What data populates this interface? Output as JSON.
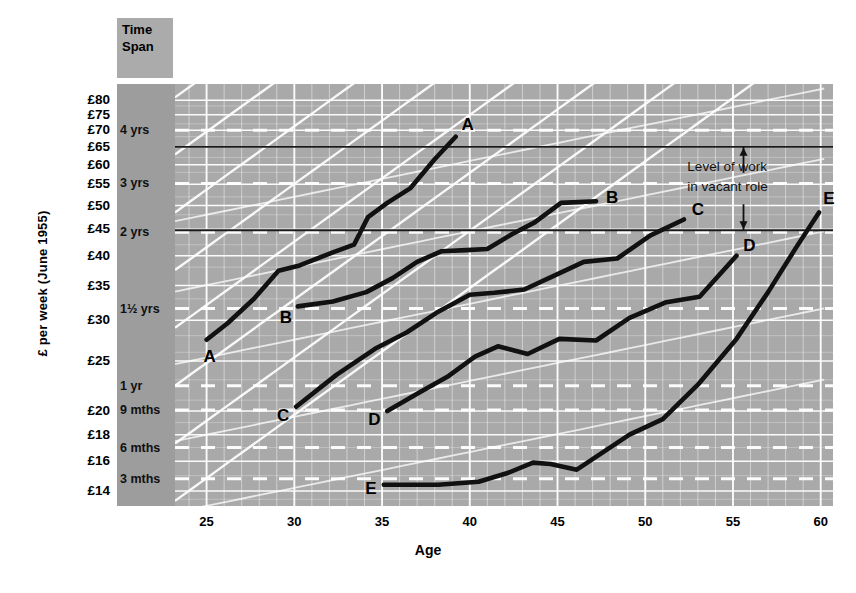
{
  "axes": {
    "ylabel": "£ per week (June 1955)",
    "xlabel": "Age",
    "timespan_header_line1": "Time",
    "timespan_header_line2": "Span",
    "x_ticks": [
      "25",
      "30",
      "35",
      "40",
      "45",
      "50",
      "55",
      "60"
    ],
    "x_tick_values": [
      25,
      30,
      35,
      40,
      45,
      50,
      55,
      60
    ],
    "x_range": [
      23.2,
      60.7
    ],
    "y_ticks": [
      "£80",
      "£75",
      "£70",
      "£65",
      "£60",
      "£55",
      "£50",
      "£45",
      "£40",
      "£35",
      "£30",
      "£25",
      "£20",
      "£18",
      "£16",
      "£14"
    ],
    "y_tick_values": [
      80,
      75,
      70,
      65,
      60,
      55,
      50,
      45,
      40,
      35,
      30,
      25,
      20,
      18,
      16,
      14
    ],
    "y_range": [
      13.1,
      86.0
    ],
    "y_scale": "log"
  },
  "timespan_labels": [
    {
      "label": "4 yrs",
      "value": 70.0
    },
    {
      "label": "3 yrs",
      "value": 55.2
    },
    {
      "label": "2 yrs",
      "value": 44.4
    },
    {
      "label": "1½ yrs",
      "value": 31.6
    },
    {
      "label": "1 yr",
      "value": 22.4
    },
    {
      "label": "9 mths",
      "value": 20.1
    },
    {
      "label": "6 mths",
      "value": 17.0
    },
    {
      "label": "3 mths",
      "value": 14.8
    }
  ],
  "reference_lines": [
    {
      "name": "upper-level-of-work",
      "value": 65.0
    },
    {
      "name": "lower-level-of-work",
      "value": 44.8
    }
  ],
  "annotation": {
    "line1": "Level of work",
    "line2": "in vacant role",
    "arrow_up": "▲",
    "arrow_down": "▼"
  },
  "chart_data": {
    "type": "line",
    "subtitle": "Earnings progression curves with time-span of discretion bands",
    "xlabel": "Age",
    "ylabel": "£ per week (June 1955)",
    "xlim": [
      23.2,
      60.7
    ],
    "ylim": [
      13.1,
      86.0
    ],
    "yscale": "log",
    "grid": true,
    "legend": "inline end-of-line labels",
    "series": [
      {
        "name": "A",
        "label_start": "A",
        "label_end": "A",
        "x": [
          25.0,
          26.2,
          27.7,
          29.1,
          30.3,
          32.2,
          33.4,
          34.2,
          35.3,
          36.6,
          38.0,
          39.2
        ],
        "y": [
          27.5,
          29.6,
          33.0,
          37.4,
          38.3,
          40.6,
          42.0,
          47.5,
          50.6,
          54.0,
          61.5,
          68.0
        ]
      },
      {
        "name": "B",
        "label_start": "B",
        "label_end": "B",
        "x": [
          30.2,
          32.2,
          34.1,
          35.6,
          37.0,
          38.4,
          39.8,
          41.0,
          42.4,
          43.7,
          45.2,
          47.2
        ],
        "y": [
          31.9,
          32.6,
          34.0,
          36.2,
          38.9,
          40.8,
          41.0,
          41.2,
          44.0,
          46.4,
          50.6,
          51.0
        ]
      },
      {
        "name": "C",
        "label_start": "C",
        "label_end": "C",
        "x": [
          30.1,
          32.4,
          34.6,
          36.4,
          38.1,
          40.0,
          41.4,
          43.1,
          44.6,
          46.5,
          48.4,
          50.3,
          52.2
        ],
        "y": [
          20.4,
          23.5,
          26.4,
          28.4,
          31.0,
          33.6,
          33.9,
          34.4,
          36.3,
          38.9,
          39.5,
          43.8,
          47.0
        ]
      },
      {
        "name": "D",
        "label_start": "D",
        "label_end": "D",
        "x": [
          35.3,
          37.1,
          38.8,
          40.3,
          41.6,
          43.3,
          45.1,
          47.2,
          49.1,
          51.2,
          53.1,
          55.2
        ],
        "y": [
          20.0,
          21.7,
          23.4,
          25.5,
          26.7,
          25.8,
          27.6,
          27.4,
          30.3,
          32.5,
          33.3,
          40.0
        ]
      },
      {
        "name": "E",
        "label_start": "E",
        "label_end": "E",
        "x": [
          35.1,
          38.2,
          40.5,
          42.2,
          43.6,
          44.6,
          46.1,
          47.3,
          49.1,
          51.0,
          53.0,
          55.2,
          57.0,
          58.6,
          59.9
        ],
        "y": [
          14.4,
          14.4,
          14.6,
          15.2,
          15.9,
          15.8,
          15.4,
          16.4,
          18.0,
          19.3,
          22.5,
          27.6,
          34.0,
          41.5,
          48.5
        ]
      }
    ]
  },
  "colors": {
    "plot_background": "#a9a9a9",
    "timespan_band": "#9d9d9d",
    "grid_line": "#ffffff",
    "curve": "#111111",
    "reference_line": "#222222",
    "page_background": "#ffffff"
  }
}
